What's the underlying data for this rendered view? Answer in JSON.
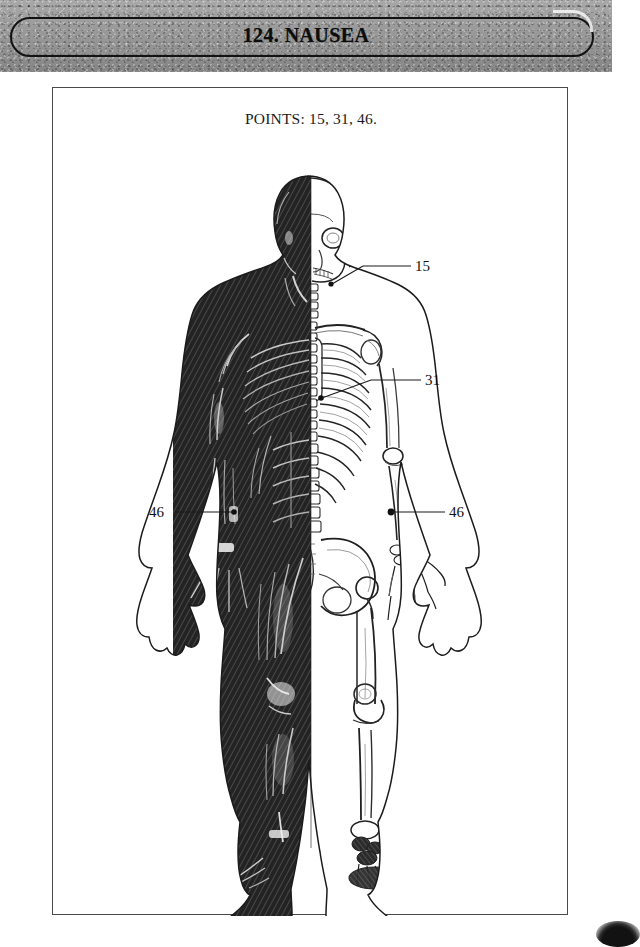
{
  "header": {
    "title": "124.  NAUSEA",
    "chapter_number": "124",
    "chapter_name": "NAUSEA",
    "bar_color": "#9a9a9a",
    "border_color": "#121212"
  },
  "page": {
    "points_line": "POINTS: 15, 31, 46.",
    "frame_border_color": "#4a4a4a",
    "background_color": "#ffffff"
  },
  "figure": {
    "caption": "Anterior view of human body, left half musculature, right half skeleton",
    "left_half": "musculature",
    "right_half": "skeleton",
    "ink_color": "#1b1b1b"
  },
  "callouts": [
    {
      "label": "15",
      "point": "15",
      "side": "right",
      "target": "jaw / mandible angle"
    },
    {
      "label": "31",
      "point": "31",
      "side": "right",
      "target": "lower rib cage / epigastrium"
    },
    {
      "label": "46",
      "point": "46",
      "side": "left",
      "target": "left wrist"
    },
    {
      "label": "46",
      "point": "46",
      "side": "right",
      "target": "right wrist"
    }
  ]
}
